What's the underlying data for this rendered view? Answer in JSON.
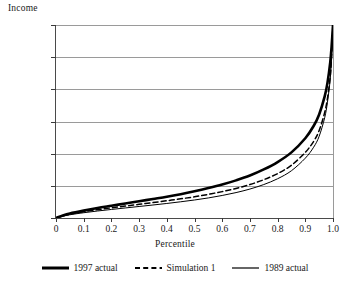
{
  "chart_data": {
    "type": "line",
    "title": "",
    "xlabel": "Percentile",
    "ylabel": "Income",
    "xlim": [
      0,
      1.0
    ],
    "ylim": [
      0,
      30000
    ],
    "grid": true,
    "legend_position": "bottom",
    "x_ticks": [
      "0",
      "0.1",
      "0.2",
      "0.3",
      "0.4",
      "0.5",
      "0.6",
      "0.7",
      "0.8",
      "0.9",
      "1.0"
    ],
    "x_tick_values": [
      0,
      0.1,
      0.2,
      0.3,
      0.4,
      0.5,
      0.6,
      0.7,
      0.8,
      0.9,
      1.0
    ],
    "y_ticks": [
      "0",
      "5,000",
      "10,000",
      "15,000",
      "20,000",
      "25,000",
      "30,000"
    ],
    "y_tick_values": [
      0,
      5000,
      10000,
      15000,
      20000,
      25000,
      30000
    ],
    "x": [
      0,
      0.01,
      0.02,
      0.05,
      0.1,
      0.15,
      0.2,
      0.25,
      0.3,
      0.35,
      0.4,
      0.45,
      0.5,
      0.55,
      0.6,
      0.65,
      0.7,
      0.75,
      0.8,
      0.85,
      0.9,
      0.93,
      0.95,
      0.97,
      0.98,
      0.99,
      0.995,
      1.0
    ],
    "series": [
      {
        "name": "1997 actual",
        "style": "solid-thick",
        "color": "#000000",
        "values": [
          0,
          180,
          330,
          700,
          1150,
          1550,
          1900,
          2250,
          2600,
          2950,
          3300,
          3700,
          4150,
          4650,
          5200,
          5850,
          6600,
          7550,
          8700,
          10200,
          12400,
          14300,
          16100,
          18900,
          21000,
          24200,
          26700,
          30000
        ]
      },
      {
        "name": "Simulation 1",
        "style": "dashed",
        "color": "#000000",
        "values": [
          0,
          150,
          280,
          600,
          980,
          1300,
          1580,
          1850,
          2120,
          2400,
          2680,
          2980,
          3300,
          3680,
          4100,
          4600,
          5200,
          5950,
          6900,
          8200,
          10200,
          11900,
          13600,
          16400,
          18600,
          22000,
          25200,
          30000
        ]
      },
      {
        "name": "1989 actual",
        "style": "solid-thin",
        "color": "#000000",
        "values": [
          0,
          120,
          230,
          500,
          820,
          1090,
          1330,
          1560,
          1790,
          2020,
          2260,
          2520,
          2800,
          3120,
          3500,
          3950,
          4500,
          5200,
          6100,
          7350,
          9300,
          11000,
          12700,
          15600,
          18000,
          21600,
          25000,
          30000
        ]
      }
    ]
  },
  "labels": {
    "y_axis_title": "Income",
    "x_axis_title": "Percentile"
  },
  "legend": {
    "items": [
      {
        "label": "1997 actual",
        "style": "solid-thick"
      },
      {
        "label": "Simulation 1",
        "style": "dashed"
      },
      {
        "label": "1989 actual",
        "style": "solid-thin"
      }
    ]
  }
}
